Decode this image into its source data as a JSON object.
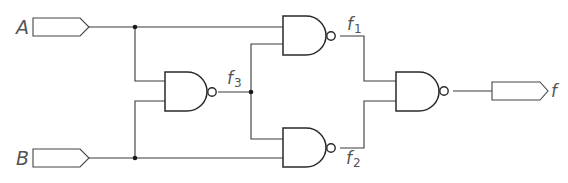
{
  "diagram": {
    "type": "logic-circuit",
    "inputs": [
      {
        "id": "A",
        "label": "A"
      },
      {
        "id": "B",
        "label": "B"
      }
    ],
    "output": {
      "id": "f",
      "label": "f"
    },
    "gates": [
      {
        "id": "g3",
        "type": "NAND",
        "inputs": [
          "A",
          "B"
        ],
        "output": "f3"
      },
      {
        "id": "g1",
        "type": "NAND",
        "inputs": [
          "A",
          "f3"
        ],
        "output": "f1"
      },
      {
        "id": "g2",
        "type": "NAND",
        "inputs": [
          "f3",
          "B"
        ],
        "output": "f2"
      },
      {
        "id": "gout",
        "type": "NAND",
        "inputs": [
          "f1",
          "f2"
        ],
        "output": "f"
      }
    ],
    "signal_labels": {
      "f1": {
        "base": "f",
        "sub": "1"
      },
      "f2": {
        "base": "f",
        "sub": "2"
      },
      "f3": {
        "base": "f",
        "sub": "3"
      }
    },
    "colors": {
      "line": "#3a3a3a",
      "label": "#555555",
      "background": "#ffffff"
    }
  }
}
